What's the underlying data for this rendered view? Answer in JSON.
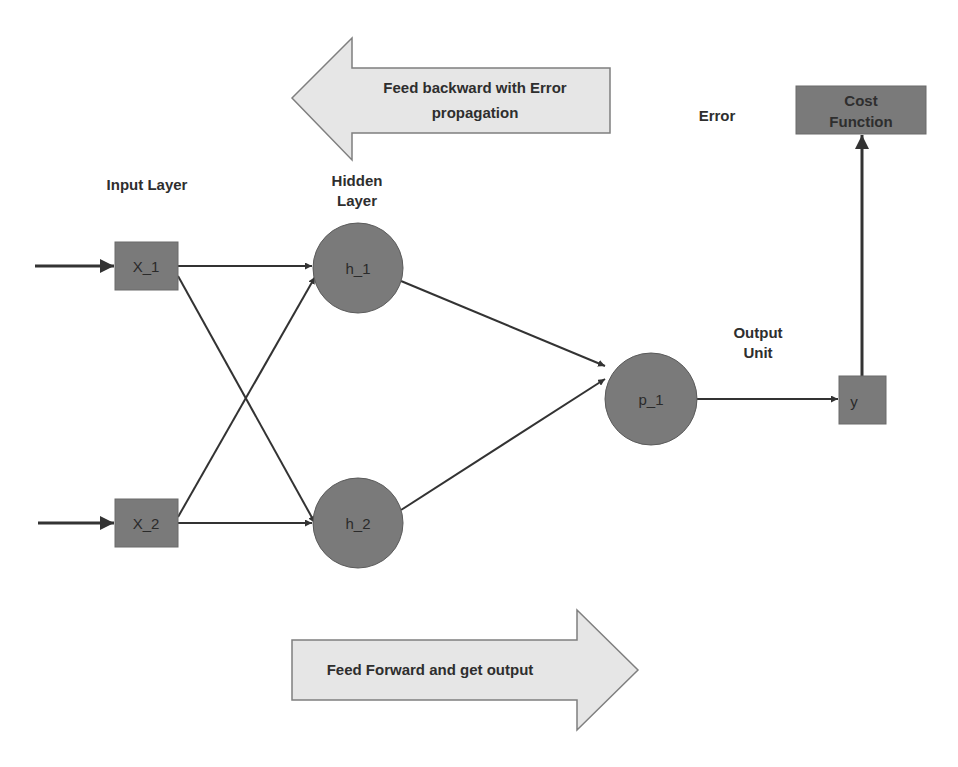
{
  "diagram": {
    "colors": {
      "node_fill": "#7a7a7a",
      "node_stroke": "#5a5a5a",
      "arrow_band_fill": "#e6e6e6",
      "arrow_band_stroke": "#7f7f7f",
      "edge": "#333333",
      "text": "#2e2e2e"
    },
    "banners": {
      "backward": {
        "line1": "Feed backward with Error",
        "line2": "propagation",
        "direction": "left"
      },
      "forward": {
        "label": "Feed Forward and get output",
        "direction": "right"
      }
    },
    "labels": {
      "input_layer": "Input Layer",
      "hidden_layer_line1": "Hidden",
      "hidden_layer_line2": "Layer",
      "output_unit_line1": "Output",
      "output_unit_line2": "Unit",
      "error": "Error"
    },
    "nodes": {
      "x1": {
        "label": "X_1",
        "shape": "square"
      },
      "x2": {
        "label": "X_2",
        "shape": "square"
      },
      "h1": {
        "label": "h_1",
        "shape": "circle"
      },
      "h2": {
        "label": "h_2",
        "shape": "circle"
      },
      "p1": {
        "label": "p_1",
        "shape": "circle"
      },
      "y": {
        "label": "y",
        "shape": "square"
      },
      "cost": {
        "line1": "Cost",
        "line2": "Function",
        "shape": "rectangle"
      }
    },
    "edges": [
      {
        "from": "input",
        "to": "x1"
      },
      {
        "from": "input",
        "to": "x2"
      },
      {
        "from": "x1",
        "to": "h1"
      },
      {
        "from": "x1",
        "to": "h2"
      },
      {
        "from": "x2",
        "to": "h1"
      },
      {
        "from": "x2",
        "to": "h2"
      },
      {
        "from": "h1",
        "to": "p1"
      },
      {
        "from": "h2",
        "to": "p1"
      },
      {
        "from": "p1",
        "to": "y"
      },
      {
        "from": "y",
        "to": "cost"
      }
    ]
  }
}
